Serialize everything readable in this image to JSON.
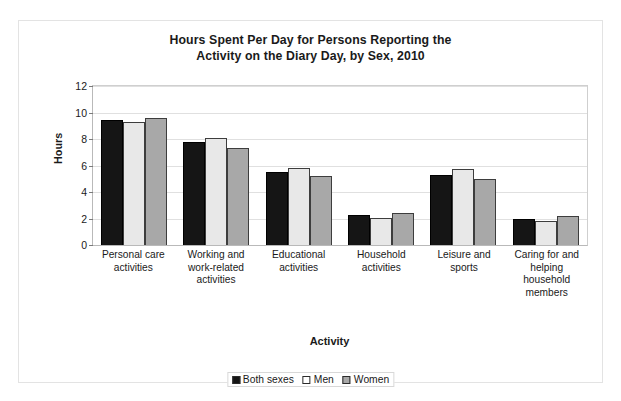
{
  "chart_data": {
    "type": "bar",
    "title": "Hours Spent Per Day for Persons Reporting the Activity on the Diary Day, by Sex, 2010",
    "title_lines": [
      "Hours Spent Per Day for Persons Reporting the",
      "Activity on the Diary Day, by Sex, 2010"
    ],
    "xlabel": "Activity",
    "ylabel": "Hours",
    "ylim": [
      0,
      12
    ],
    "ytick_values": [
      0,
      2,
      4,
      6,
      8,
      10,
      12
    ],
    "ytick_labels": [
      "0",
      "2",
      "4",
      "6",
      "8",
      "10",
      "12"
    ],
    "grid": true,
    "legend_position": "bottom",
    "categories": [
      "Personal care activities",
      "Working and work-related activities",
      "Educational activities",
      "Household activities",
      "Leisure and sports",
      "Caring for and helping household members"
    ],
    "category_label_lines": [
      [
        "Personal care",
        "activities"
      ],
      [
        "Working and",
        "work-related",
        "activities"
      ],
      [
        "Educational",
        "activities"
      ],
      [
        "Household",
        "activities"
      ],
      [
        "Leisure and",
        "sports"
      ],
      [
        "Caring for and",
        "helping",
        "household",
        "members"
      ]
    ],
    "series": [
      {
        "name": "Both sexes",
        "color": "#151515",
        "values": [
          9.4,
          7.8,
          5.5,
          2.3,
          5.3,
          2.0
        ]
      },
      {
        "name": "Men",
        "color": "#e8e8e8",
        "values": [
          9.25,
          8.1,
          5.85,
          2.05,
          5.7,
          1.8
        ]
      },
      {
        "name": "Women",
        "color": "#a8a8a8",
        "values": [
          9.6,
          7.3,
          5.2,
          2.45,
          4.95,
          2.2
        ]
      }
    ]
  },
  "colors": {
    "both_sexes": "#151515",
    "men": "#e8e8e8",
    "women": "#a8a8a8",
    "gridline": "#e0e0e0",
    "axis": "#b9b9b9",
    "frame": "#e3e3e3",
    "text": "#1a1a1a"
  }
}
